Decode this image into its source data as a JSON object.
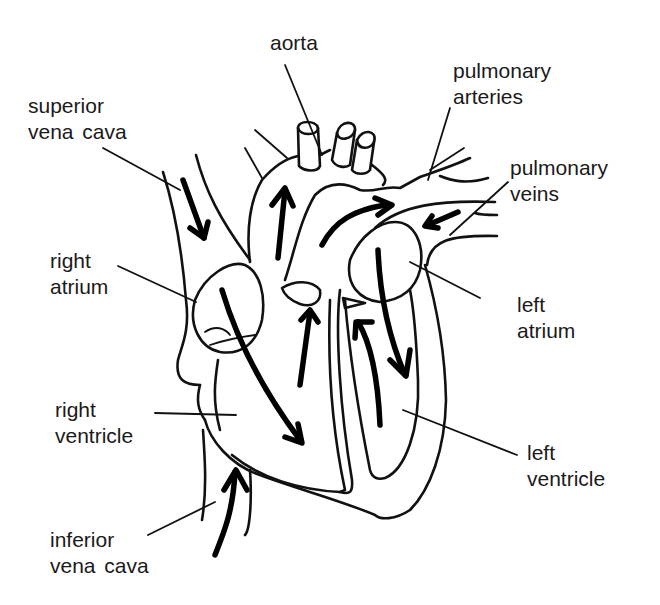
{
  "diagram": {
    "type": "heart-blood-flow",
    "line_color": "#111111",
    "background": "#ffffff",
    "labels": {
      "aorta": {
        "line1": "aorta"
      },
      "pulmonary_arteries": {
        "line1": "pulmonary",
        "line2": "arteries"
      },
      "superior_vena_cava": {
        "line1": "superior",
        "line2": "vena  cava"
      },
      "pulmonary_veins": {
        "line1": "pulmonary",
        "line2": "veins"
      },
      "right_atrium": {
        "line1": "right",
        "line2": "atrium"
      },
      "left_atrium": {
        "line1": "left",
        "line2": "atrium"
      },
      "right_ventricle": {
        "line1": "right",
        "line2": "ventricle"
      },
      "left_ventricle": {
        "line1": "left",
        "line2": "ventricle"
      },
      "inferior_vena_cava": {
        "line1": "inferior",
        "line2": "vena  cava"
      }
    }
  }
}
